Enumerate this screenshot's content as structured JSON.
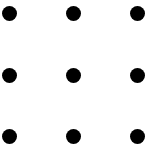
{
  "diagram": {
    "type": "dot-grid",
    "rows": 3,
    "cols": 3,
    "dot_color": "#000000",
    "background": "#ffffff",
    "dot_diameter": 15,
    "dots": [
      {
        "row": 0,
        "col": 0,
        "cx": 9,
        "cy": 13
      },
      {
        "row": 0,
        "col": 1,
        "cx": 73,
        "cy": 13
      },
      {
        "row": 0,
        "col": 2,
        "cx": 137,
        "cy": 13
      },
      {
        "row": 1,
        "col": 0,
        "cx": 9,
        "cy": 75
      },
      {
        "row": 1,
        "col": 1,
        "cx": 73,
        "cy": 75
      },
      {
        "row": 1,
        "col": 2,
        "cx": 137,
        "cy": 75
      },
      {
        "row": 2,
        "col": 0,
        "cx": 9,
        "cy": 136
      },
      {
        "row": 2,
        "col": 1,
        "cx": 73,
        "cy": 136
      },
      {
        "row": 2,
        "col": 2,
        "cx": 137,
        "cy": 136
      }
    ]
  }
}
